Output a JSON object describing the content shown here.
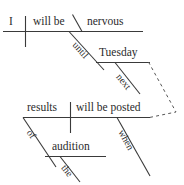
{
  "diagram": {
    "type": "reed-kellogg-sentence-diagram",
    "sentence": "I will be nervous until Tuesday next when results of the audition will be posted.",
    "ink_color": "#2b2b2b",
    "line_color": "#3a3a3a",
    "background": "#ffffff",
    "clauses": [
      {
        "id": "main-clause",
        "subject": "I",
        "verb": "will be",
        "predicate_adjective": "nervous"
      },
      {
        "id": "subordinate-clause",
        "subject": "results",
        "verb": "will be posted"
      }
    ],
    "words": {
      "subject_main": "I",
      "verb_main": "will be",
      "predicate_adjective": "nervous",
      "preposition_until": "until",
      "object_tuesday": "Tuesday",
      "modifier_next": "next",
      "subject_sub": "results",
      "verb_sub": "will be posted",
      "conjunction_when": "when",
      "preposition_of": "of",
      "object_audition": "audition",
      "article_the": "the"
    },
    "connectors": [
      {
        "name": "predicate-adjective-slant",
        "kind": "solid-backslant"
      },
      {
        "name": "until-prepositional-slant",
        "kind": "solid-slant"
      },
      {
        "name": "next-modifier-slant",
        "kind": "solid-slant"
      },
      {
        "name": "when-conjunction-slant",
        "kind": "solid-slant"
      },
      {
        "name": "of-prepositional-slant",
        "kind": "solid-slant"
      },
      {
        "name": "the-article-slant",
        "kind": "solid-slant"
      },
      {
        "name": "clause-link-dashed",
        "kind": "dashed-bracket"
      }
    ]
  }
}
